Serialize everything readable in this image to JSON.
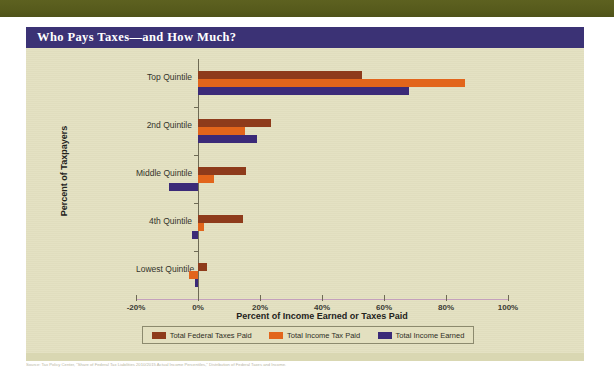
{
  "header": {
    "title": "Who Pays Taxes—and How Much?"
  },
  "colors": {
    "top_band": "#5b5f1e",
    "title_bar": "#3b3275",
    "panel": "#e3e0c0",
    "series_federal_taxes": "#8e3b1b",
    "series_income_tax": "#e2651b",
    "series_income_earned": "#3b2a78",
    "axis": "#6e6a54"
  },
  "footer": {
    "note": "Source: Tax Policy Center, \"Share of Federal Tax Liabilities 2010/2015 Actual Income Percentiles,\" Distribution of Federal Taxes and Income."
  },
  "chart_data": {
    "type": "bar",
    "orientation": "horizontal",
    "title": "Who Pays Taxes—and How Much?",
    "xlabel": "Percent of Income Earned or Taxes Paid",
    "ylabel": "Percent of Taxpayers",
    "categories": [
      "Top Quintile",
      "2nd Quintile",
      "Middle Quintile",
      "4th Quintile",
      "Lowest Quintile"
    ],
    "xlim": [
      -20,
      100
    ],
    "xticks": [
      -20,
      0,
      20,
      40,
      60,
      80,
      100
    ],
    "xtick_labels": [
      "-20%",
      "0%",
      "20%",
      "40%",
      "60%",
      "80%",
      "100%"
    ],
    "grid": false,
    "legend_position": "bottom",
    "series": [
      {
        "name": "Total Federal Taxes Paid",
        "color": "#8e3b1b",
        "values": [
          53,
          23.5,
          15.5,
          14.5,
          3
        ]
      },
      {
        "name": "Total Income Tax Paid",
        "color": "#e2651b",
        "values": [
          86,
          15,
          5,
          2,
          -3
        ]
      },
      {
        "name": "Total Income Earned",
        "color": "#3b2a78",
        "values": [
          68,
          19,
          -9.5,
          -2,
          -1
        ]
      }
    ]
  }
}
